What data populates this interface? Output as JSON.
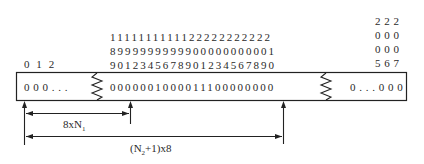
{
  "diagram": {
    "left_header": "0 1 2",
    "middle_header": {
      "row1": "1111111111122222222222",
      "row2": "8999999999900000000001",
      "row3": "9012345678901234567890"
    },
    "right_header": {
      "row1": "2 2 2",
      "row2": "0 0 0",
      "row3": "0 0 0",
      "row4": "5 6 7"
    },
    "bitfield": {
      "left_segment": "0 0 0 . . .",
      "middle_segment": "0000001000011100000000",
      "right_segment": "0 . . . 0 0 0"
    },
    "dimensions": {
      "offset_label_main": "8xN",
      "offset_label_sub": "1",
      "length_label_prefix": "(N",
      "length_label_sub": "2",
      "length_label_suffix": "+1)x8"
    }
  }
}
